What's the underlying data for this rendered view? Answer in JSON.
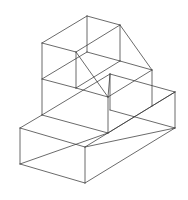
{
  "figure": {
    "type": "isometric-wireframe",
    "background": "#ffffff",
    "stroke_color": "#3a3a3a",
    "edges": [
      [
        87,
        16,
        120,
        25
      ],
      [
        87,
        16,
        42,
        43
      ],
      [
        42,
        43,
        76,
        52
      ],
      [
        76,
        52,
        120,
        25
      ],
      [
        87,
        16,
        87,
        52
      ],
      [
        120,
        25,
        152,
        70
      ],
      [
        120,
        25,
        120,
        61
      ],
      [
        87,
        52,
        120,
        61
      ],
      [
        87,
        52,
        42,
        79
      ],
      [
        120,
        61,
        152,
        70
      ],
      [
        120,
        61,
        76,
        88
      ],
      [
        76,
        52,
        76,
        88
      ],
      [
        76,
        52,
        108,
        97
      ],
      [
        42,
        43,
        42,
        115
      ],
      [
        42,
        79,
        76,
        88
      ],
      [
        76,
        88,
        108,
        97
      ],
      [
        152,
        70,
        152,
        106
      ],
      [
        152,
        70,
        108,
        97
      ],
      [
        110,
        74,
        175,
        92
      ],
      [
        110,
        74,
        108,
        97
      ],
      [
        110,
        74,
        110,
        110
      ],
      [
        175,
        92,
        175,
        128
      ],
      [
        175,
        92,
        152,
        106
      ],
      [
        108,
        97,
        108,
        133
      ],
      [
        42,
        115,
        108,
        133
      ],
      [
        42,
        115,
        20,
        128
      ],
      [
        152,
        106,
        85,
        147
      ],
      [
        20,
        128,
        85,
        147
      ],
      [
        85,
        147,
        175,
        128
      ],
      [
        20,
        128,
        20,
        164
      ],
      [
        85,
        147,
        85,
        183
      ],
      [
        20,
        164,
        85,
        183
      ],
      [
        85,
        183,
        175,
        128
      ],
      [
        20,
        164,
        108,
        133
      ],
      [
        108,
        133,
        175,
        92
      ],
      [
        42,
        115,
        110,
        74
      ],
      [
        110,
        110,
        175,
        128
      ]
    ]
  }
}
